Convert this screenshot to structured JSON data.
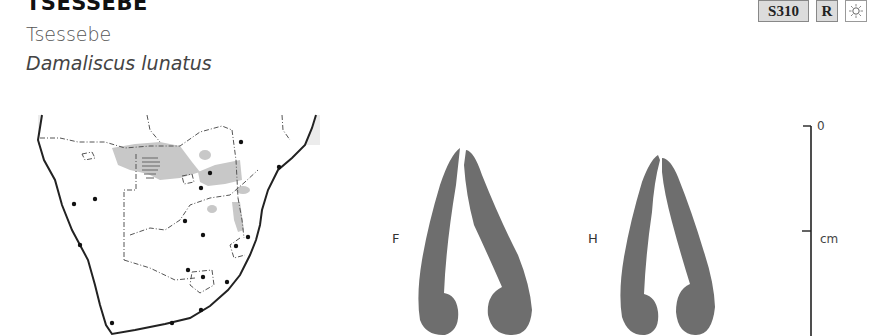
{
  "header": {
    "title": "TSESSEBE",
    "common_name": "Tsessebe",
    "scientific_name": "Damaliscus lunatus"
  },
  "badges": [
    {
      "label": "S310",
      "icon": null
    },
    {
      "label": "R",
      "icon": null
    },
    {
      "label": "",
      "icon": "sun-icon"
    }
  ],
  "map": {
    "region": "southern-africa-distribution-map",
    "range_color": "#c8c8c8",
    "ocean_color": "#ececec"
  },
  "horn_diagrams": [
    {
      "label": "F"
    },
    {
      "label": "H"
    }
  ],
  "scale_bar": {
    "zero_label": "0",
    "unit_label": "cm"
  },
  "colors": {
    "horn_fill": "#6e6e6e",
    "badge_bg": "#dcdcdc"
  }
}
